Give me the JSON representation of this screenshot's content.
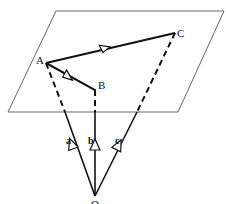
{
  "diagram": {
    "type": "vector-geometry",
    "plane": {
      "corners": [
        [
          56,
          11
        ],
        [
          224,
          11
        ],
        [
          178,
          112
        ],
        [
          8,
          112
        ]
      ],
      "stroke": "#555555"
    },
    "points": {
      "A": {
        "label": "A",
        "x": 46,
        "y": 63
      },
      "B": {
        "label": "B",
        "x": 95,
        "y": 90
      },
      "C": {
        "label": "C",
        "x": 175,
        "y": 33
      },
      "O": {
        "label": "O",
        "x": 95,
        "y": 196
      }
    },
    "segments": [
      {
        "from": "A",
        "to": "C",
        "style": "solid",
        "arrow": true
      },
      {
        "from": "A",
        "to": "B",
        "style": "solid",
        "arrow": true
      }
    ],
    "vectors": [
      {
        "name": "a",
        "label": "a",
        "from": "O",
        "to": "A"
      },
      {
        "name": "b",
        "label": "b",
        "from": "O",
        "to": "B"
      },
      {
        "name": "c",
        "label": "c",
        "from": "O",
        "to": "C"
      }
    ],
    "colors": {
      "line": "#111111",
      "plane": "#666666",
      "background": "#ffffff"
    }
  }
}
